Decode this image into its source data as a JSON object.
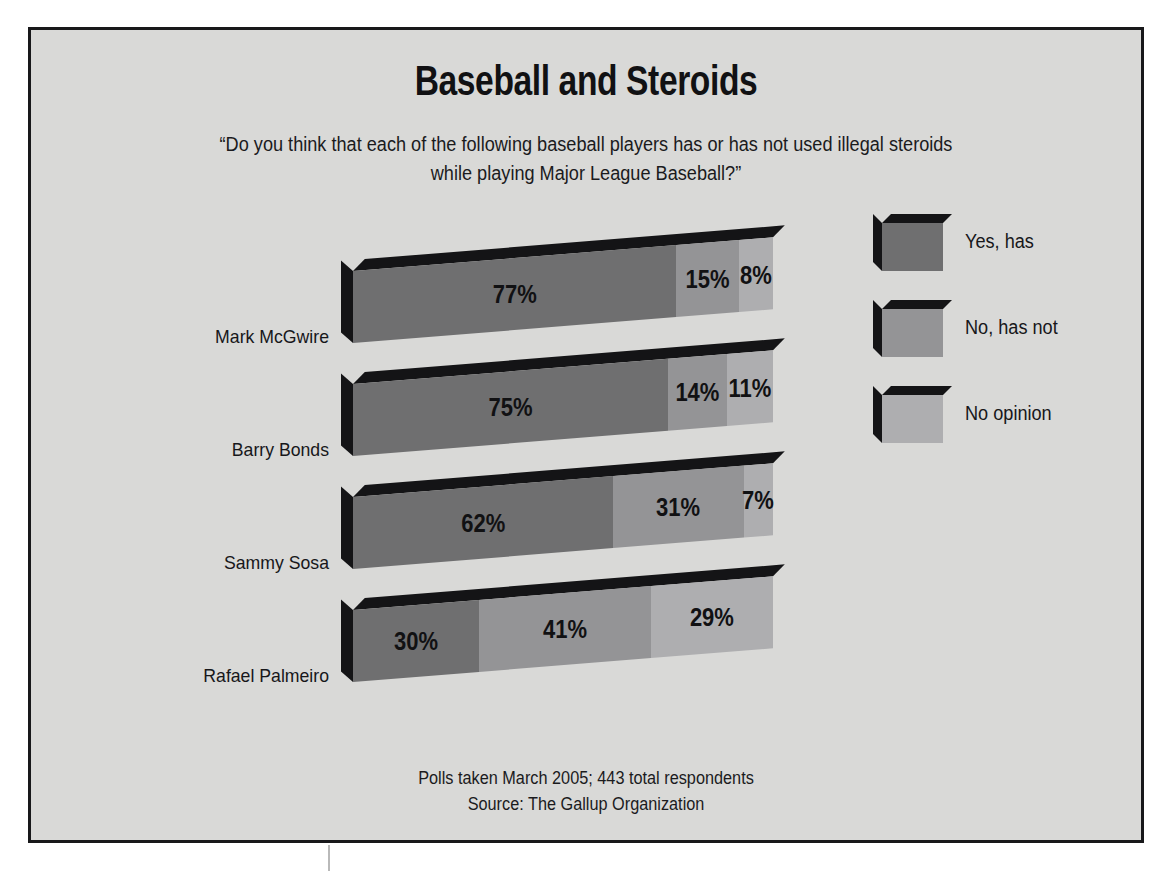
{
  "title": "Baseball and Steroids",
  "subtitle": "“Do you think that each of the following baseball players has or has not used illegal steroids while playing Major League Baseball?”",
  "footer": {
    "line1": "Polls taken March 2005; 443 total respondents",
    "line2": "Source: The Gallup Organization"
  },
  "legend": {
    "items": [
      {
        "label": "Yes, has",
        "color": "#6f6f70"
      },
      {
        "label": "No, has not",
        "color": "#949496"
      },
      {
        "label": "No opinion",
        "color": "#aeaeb0"
      }
    ]
  },
  "chart_data": {
    "type": "bar",
    "orientation": "horizontal",
    "stacked": true,
    "stack_total": 100,
    "title": "Baseball and Steroids",
    "subtitle": "“Do you think that each of the following baseball players has or has not used illegal steroids while playing Major League Baseball?”",
    "xlabel": "",
    "ylabel": "",
    "xlim": [
      0,
      100
    ],
    "grid": false,
    "legend_position": "right",
    "units": "percent",
    "categories": [
      "Mark McGwire",
      "Barry Bonds",
      "Sammy Sosa",
      "Rafael Palmeiro"
    ],
    "series": [
      {
        "name": "Yes, has",
        "color": "#6f6f70",
        "values": [
          77,
          75,
          62,
          30
        ]
      },
      {
        "name": "No, has not",
        "color": "#949496",
        "values": [
          15,
          14,
          31,
          41
        ]
      },
      {
        "name": "No opinion",
        "color": "#aeaeb0",
        "values": [
          8,
          11,
          7,
          29
        ]
      }
    ],
    "data_labels": [
      {
        "category": "Mark McGwire",
        "labels": [
          "77%",
          "15%",
          "8%"
        ]
      },
      {
        "category": "Barry Bonds",
        "labels": [
          "75%",
          "14%",
          "11%"
        ]
      },
      {
        "category": "Sammy Sosa",
        "labels": [
          "62%",
          "31%",
          "7%"
        ]
      },
      {
        "category": "Rafael Palmeiro",
        "labels": [
          "30%",
          "41%",
          "29%"
        ]
      }
    ],
    "annotations": [
      "Polls taken March 2005; 443 total respondents",
      "Source: The Gallup Organization"
    ]
  },
  "rows": [
    {
      "label": "Mark McGwire",
      "segments": [
        {
          "value": "77%",
          "pct": 77,
          "kind": "yes",
          "outside": false
        },
        {
          "value": "15%",
          "pct": 15,
          "kind": "no",
          "outside": false
        },
        {
          "value": "8%",
          "pct": 8,
          "kind": "noop",
          "outside": true
        }
      ]
    },
    {
      "label": "Barry Bonds",
      "segments": [
        {
          "value": "75%",
          "pct": 75,
          "kind": "yes",
          "outside": false
        },
        {
          "value": "14%",
          "pct": 14,
          "kind": "no",
          "outside": false
        },
        {
          "value": "11%",
          "pct": 11,
          "kind": "noop",
          "outside": true
        }
      ]
    },
    {
      "label": "Sammy Sosa",
      "segments": [
        {
          "value": "62%",
          "pct": 62,
          "kind": "yes",
          "outside": false
        },
        {
          "value": "31%",
          "pct": 31,
          "kind": "no",
          "outside": false
        },
        {
          "value": "7%",
          "pct": 7,
          "kind": "noop",
          "outside": true
        }
      ]
    },
    {
      "label": "Rafael Palmeiro",
      "segments": [
        {
          "value": "30%",
          "pct": 30,
          "kind": "yes",
          "outside": false
        },
        {
          "value": "41%",
          "pct": 41,
          "kind": "no",
          "outside": false
        },
        {
          "value": "29%",
          "pct": 29,
          "kind": "noop",
          "outside": false
        }
      ]
    }
  ]
}
